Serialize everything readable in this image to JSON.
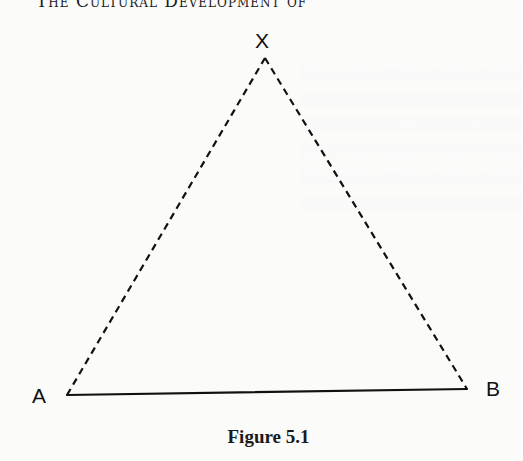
{
  "page": {
    "running_head": "The Cultural Development of"
  },
  "figure": {
    "caption": "Figure 5.1",
    "vertices": [
      {
        "label": "X",
        "x": 265,
        "y": 58,
        "label_x": 255,
        "label_y": 30
      },
      {
        "label": "A",
        "x": 67,
        "y": 395,
        "label_x": 32,
        "label_y": 385
      },
      {
        "label": "B",
        "x": 467,
        "y": 389,
        "label_x": 486,
        "label_y": 378
      }
    ],
    "edges": [
      {
        "from": "A",
        "to": "B",
        "style": "solid"
      },
      {
        "from": "A",
        "to": "X",
        "style": "dashed"
      },
      {
        "from": "X",
        "to": "B",
        "style": "dashed"
      }
    ],
    "colors": {
      "ink": "#111111",
      "paper": "#fbfbfa"
    }
  }
}
